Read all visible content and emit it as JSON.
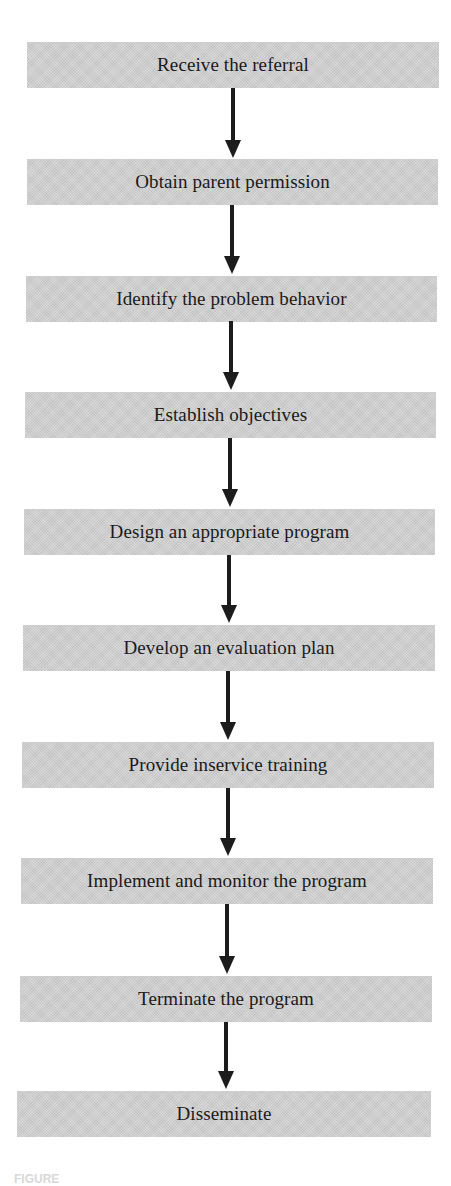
{
  "diagram": {
    "type": "flowchart",
    "direction": "top-to-bottom",
    "box_color": "#cfcfcf",
    "arrow_color": "#1c1c1c",
    "steps": [
      {
        "label": "Receive the referral"
      },
      {
        "label": "Obtain parent permission"
      },
      {
        "label": "Identify the problem behavior"
      },
      {
        "label": "Establish objectives"
      },
      {
        "label": "Design an appropriate program"
      },
      {
        "label": "Develop an evaluation plan"
      },
      {
        "label": "Provide inservice training"
      },
      {
        "label": "Implement and monitor the program"
      },
      {
        "label": "Terminate the program"
      },
      {
        "label": "Disseminate"
      }
    ],
    "caption": "FIGURE"
  }
}
